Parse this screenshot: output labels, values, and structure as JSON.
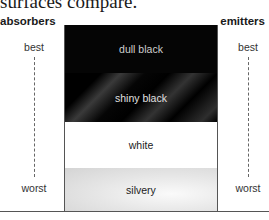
{
  "caption": "surfaces compare.",
  "headers": {
    "left": "absorbers",
    "right": "emitters"
  },
  "scale": {
    "best": "best",
    "worst": "worst"
  },
  "surfaces": [
    {
      "label": "dull black",
      "color": "#050505"
    },
    {
      "label": "shiny black",
      "color": "#111111"
    },
    {
      "label": "white",
      "color": "#ffffff"
    },
    {
      "label": "silvery",
      "color": "#e0e0e0"
    }
  ]
}
